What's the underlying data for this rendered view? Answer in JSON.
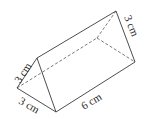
{
  "figure": {
    "shape": "triangular-prism",
    "labels": {
      "front_left_edge": "3 cm",
      "front_bottom_edge": "3 cm",
      "length_edge": "6 cm",
      "back_right_edge": "3 cm"
    },
    "colors": {
      "line": "#3a3a3a",
      "background": "#ffffff"
    }
  }
}
